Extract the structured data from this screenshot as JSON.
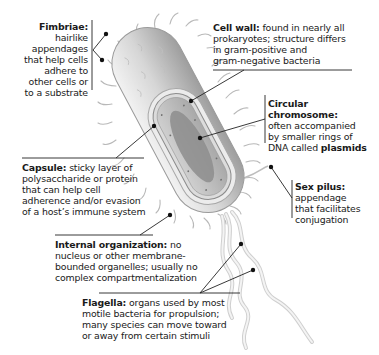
{
  "diagram": {
    "labels": {
      "fimbriae": {
        "term": "Fimbriae:",
        "lines": [
          "hairlike",
          "appendages",
          "that help cells",
          "adhere to",
          "other cells or",
          "to a substrate"
        ]
      },
      "cell_wall": {
        "term": "Cell wall:",
        "lines": [
          " found in nearly all",
          "prokaryotes; structure differs",
          "in gram-positive and",
          "gram-negative bacteria"
        ]
      },
      "circular_chromosome": {
        "term": "Circular chromosome:",
        "lines": [
          "often accompanied",
          "by smaller rings of",
          "DNA called "
        ],
        "emphasis": "plasmids"
      },
      "capsule": {
        "term": "Capsule:",
        "lines": [
          " sticky layer of",
          "polysaccharide or protein",
          "that can help cell",
          "adherence and/or evasion",
          "of a host’s immune system"
        ]
      },
      "sex_pilus": {
        "term": "Sex pilus:",
        "lines": [
          "appendage",
          "that facilitates",
          "conjugation"
        ]
      },
      "internal_organization": {
        "term": "Internal organization:",
        "lines": [
          " no",
          "nucleus or other membrane-",
          "bounded organelles; usually no",
          "complex compartmentalization"
        ]
      },
      "flagella": {
        "term": "Flagella:",
        "lines": [
          " organs used by most",
          "motile bacteria for propulsion;",
          "many species can move toward",
          "or away from certain stimuli"
        ]
      }
    },
    "colors": {
      "text": "#1a1a1a",
      "leader_line": "#222222",
      "cell_body": "#d9d9d9",
      "cytoplasm": "#bdbdbd",
      "chromosome": "#8a8a8a",
      "appendage": "#e6e6e6"
    }
  }
}
